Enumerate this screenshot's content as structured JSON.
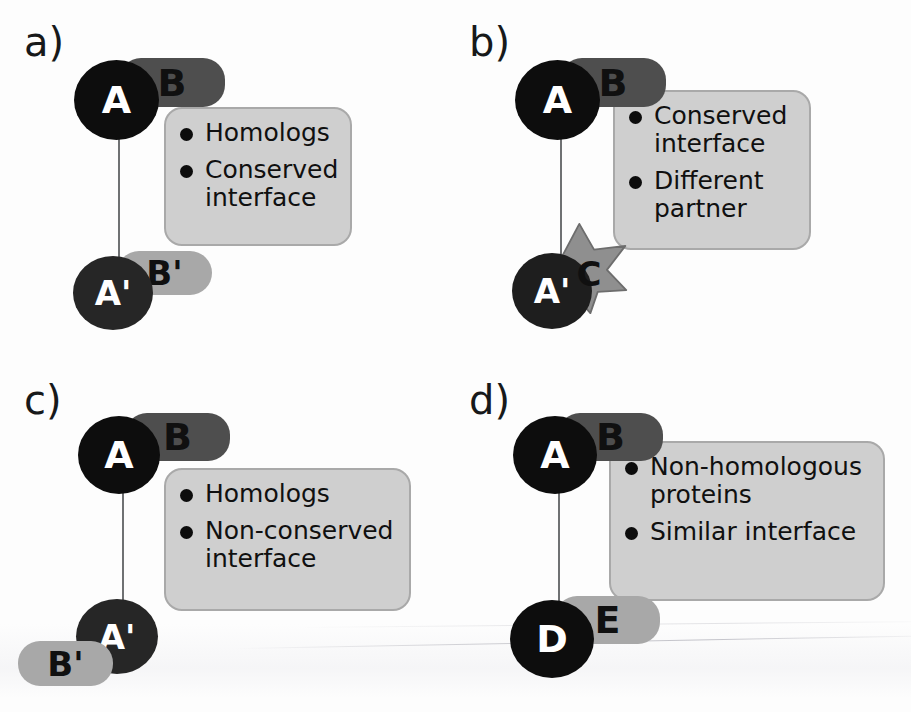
{
  "figure": {
    "background_color": "#fdfdfd"
  },
  "palette": {
    "black": "#0d0d0d",
    "near_black": "#1e1e1e",
    "dark_gray": "#4e4e4e",
    "mid_gray": "#8f8f8f",
    "light_gray_node": "#a8a8a8",
    "callout_fill": "#cfcfcf",
    "callout_border": "#a9a9a9",
    "connector": "#6f7173",
    "white_text": "#ffffff",
    "black_text": "#101010"
  },
  "panels": [
    {
      "id": "a",
      "label": "a)",
      "nodes": {
        "top_left": {
          "text": "A",
          "shape": "circle",
          "fill": "#0d0d0d",
          "text_color": "#ffffff"
        },
        "top_right": {
          "text": "B",
          "shape": "pill",
          "fill": "#4e4e4e",
          "text_color": "#101010"
        },
        "bottom_left": {
          "text": "A'",
          "shape": "circle",
          "fill": "#262626",
          "text_color": "#ffffff"
        },
        "bottom_right": {
          "text": "B'",
          "shape": "pill",
          "fill": "#a8a8a8",
          "text_color": "#101010"
        }
      },
      "callout": {
        "bullets": [
          "Homologs",
          "Conserved interface"
        ]
      }
    },
    {
      "id": "b",
      "label": "b)",
      "nodes": {
        "top_left": {
          "text": "A",
          "shape": "circle",
          "fill": "#0d0d0d",
          "text_color": "#ffffff"
        },
        "top_right": {
          "text": "B",
          "shape": "pill",
          "fill": "#4e4e4e",
          "text_color": "#101010"
        },
        "bottom_left": {
          "text": "A'",
          "shape": "circle",
          "fill": "#1e1e1e",
          "text_color": "#ffffff"
        },
        "bottom_right": {
          "text": "C",
          "shape": "star",
          "fill": "#8f8f8f",
          "text_color": "#101010"
        }
      },
      "callout": {
        "bullets": [
          "Conserved interface",
          "Different partner"
        ]
      }
    },
    {
      "id": "c",
      "label": "c)",
      "nodes": {
        "top_left": {
          "text": "A",
          "shape": "circle",
          "fill": "#0d0d0d",
          "text_color": "#ffffff"
        },
        "top_right": {
          "text": "B",
          "shape": "pill",
          "fill": "#4e4e4e",
          "text_color": "#101010"
        },
        "bottom_left": {
          "text": "A'",
          "shape": "circle",
          "fill": "#262626",
          "text_color": "#ffffff"
        },
        "bottom_right": {
          "text": "B'",
          "shape": "pill",
          "fill": "#a8a8a8",
          "text_color": "#101010"
        }
      },
      "callout": {
        "bullets": [
          "Homologs",
          "Non-conserved interface"
        ]
      }
    },
    {
      "id": "d",
      "label": "d)",
      "nodes": {
        "top_left": {
          "text": "A",
          "shape": "circle",
          "fill": "#0d0d0d",
          "text_color": "#ffffff"
        },
        "top_right": {
          "text": "B",
          "shape": "pill",
          "fill": "#4e4e4e",
          "text_color": "#101010"
        },
        "bottom_left": {
          "text": "D",
          "shape": "circle",
          "fill": "#0d0d0d",
          "text_color": "#ffffff"
        },
        "bottom_right": {
          "text": "E",
          "shape": "pill",
          "fill": "#a8a8a8",
          "text_color": "#101010"
        }
      },
      "callout": {
        "bullets": [
          "Non-homologous proteins",
          "Similar interface"
        ]
      }
    }
  ]
}
